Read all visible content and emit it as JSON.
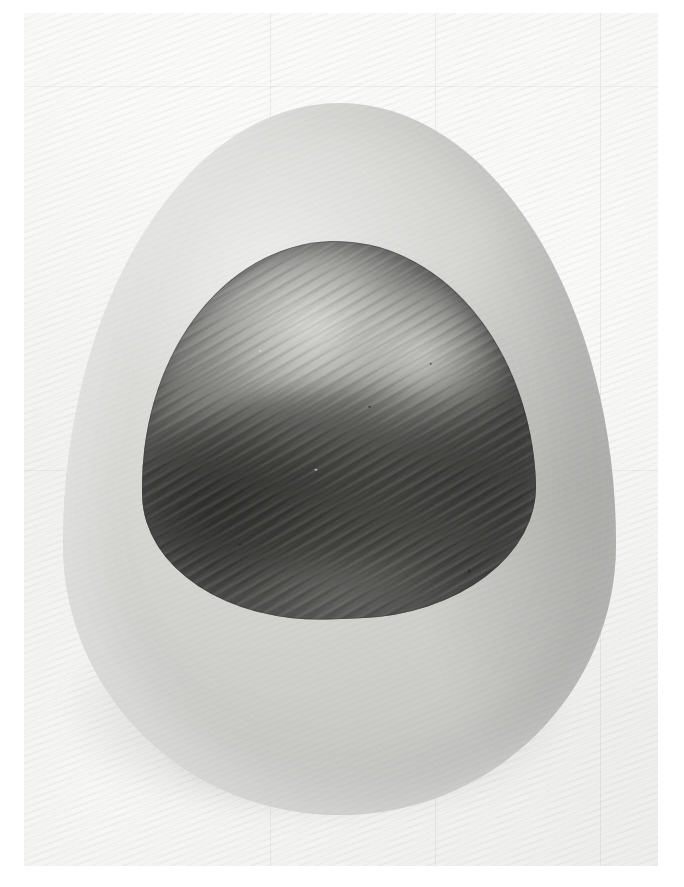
{
  "artwork": {
    "title": "Untitled (Egg Form with Dark Inner Stone)",
    "medium": "Grayscale photograph / graphite and wash on textured paper",
    "orientation": "portrait",
    "canvas": {
      "width_px": 684,
      "height_px": 887,
      "border_color": "#ffffff",
      "border_left_px": 24,
      "border_top_px": 13,
      "border_right_px": 26,
      "border_bottom_px": 21
    },
    "palette": {
      "paper_light": "#fbfbfa",
      "paper_base": "#f1f1f0",
      "paper_shade": "#ededec",
      "shell_light": "#e2e2e0",
      "shell_base": "#d9d9d6",
      "shell_shade": "#cbcbc8",
      "inner_highlight": "#e2e2de",
      "inner_mid": "#8a8a87",
      "inner_dark": "#4c4c49",
      "inner_deepest": "#222220",
      "cast_shadow": "#5f5f5f"
    },
    "subjects": [
      {
        "name": "paper-plate",
        "description": "Pale warm-grey sheet with fine diagonal ripple weave and soft tonal unevenness",
        "bounds_px": {
          "left": 24,
          "top": 13,
          "width": 634,
          "height": 853
        }
      },
      {
        "name": "egg-outer",
        "description": "Large pale grey egg / ovoid shell form, apex up, lit from the upper left",
        "bounds_px": {
          "left": 63,
          "top": 103,
          "width": 553,
          "height": 712
        }
      },
      {
        "name": "inner-form",
        "description": "Dark rounded-triangular inner form (stone / pit) set into the shell cavity, light dome at the top and a bright crescent ridge on the right shoulder, deep shadow across the lower two thirds, diagonal brush striations throughout",
        "bounds_px": {
          "left": 140,
          "top": 241,
          "width": 394,
          "height": 378
        }
      },
      {
        "name": "egg-shadow",
        "description": "Soft diffuse cast shadow pooling beneath and to the lower left of the egg form",
        "bounds_px": {
          "left": 32,
          "top": 560,
          "width": 570,
          "height": 290
        }
      }
    ],
    "seams": {
      "description": "Very faint vertical and horizontal seam lines crossing the sheet",
      "vertical_x_px": [
        270,
        435,
        600
      ],
      "horizontal_y_px": [
        86,
        470
      ]
    },
    "texture": {
      "paper_weave_angle_deg": -22,
      "inner_striation_angle_deg": -27,
      "note": "Fine parallel ripples read as both paper tooth and directional brush grain"
    },
    "lighting": {
      "direction": "upper left",
      "key": "diffuse soft",
      "contrast": "low on the shell, high inside the cavity"
    }
  }
}
